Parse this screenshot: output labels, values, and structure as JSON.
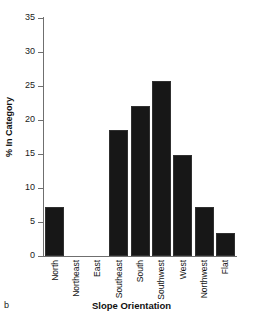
{
  "figure": {
    "panel_label": "b",
    "title_clipped": "",
    "axis_color": "#6f6f6f",
    "bar_color": "#171717"
  },
  "chart_data": {
    "type": "bar",
    "title": "",
    "xlabel": "Slope Orientation",
    "ylabel": "% In Category",
    "categories": [
      "North",
      "Northeast",
      "East",
      "Southeast",
      "South",
      "Southwest",
      "West",
      "Northwest",
      "Flat"
    ],
    "values": [
      7.2,
      0,
      0,
      18.5,
      22.0,
      25.7,
      14.8,
      7.2,
      3.4
    ],
    "ylim": [
      0,
      35
    ],
    "yticks": [
      0,
      5,
      10,
      15,
      20,
      25,
      30,
      35
    ],
    "yticklabels": [
      "0",
      "5",
      "10",
      "15",
      "20",
      "25",
      "30",
      "35"
    ],
    "grid": false,
    "legend": "none"
  }
}
